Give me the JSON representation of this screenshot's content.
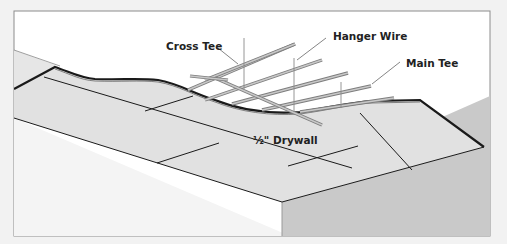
{
  "diagram": {
    "type": "suspended ceiling installation illustration",
    "labels": {
      "cross_tee": "Cross Tee",
      "hanger_wire": "Hanger Wire",
      "main_tee": "Main Tee",
      "drywall": "½\" Drywall"
    },
    "colors": {
      "page_background": "#f2f2f2",
      "frame_background": "#ffffff",
      "frame_border": "#8c8c8c",
      "drywall_fill": "#e1e1e1",
      "right_wall_fill": "#c9c9c9",
      "left_wall_fill": "#f3f3f3",
      "outline": "#1a1a1a",
      "grid_metal": "#b9b9b9",
      "grid_metal_edge": "#7d7d7d",
      "leader_line": "#666666"
    }
  }
}
